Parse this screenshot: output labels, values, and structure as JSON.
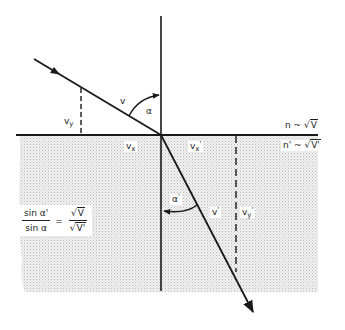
{
  "diagram": {
    "type": "refraction-of-velocity-vector",
    "colors": {
      "line": "#1a1a1a",
      "shading": "#d8d8d8",
      "background": "#ffffff"
    },
    "labels": {
      "v": "v",
      "alpha": "α",
      "vy": "v",
      "vy_sub": "y",
      "vx": "v",
      "vx_sub": "x",
      "vx_prime": "v",
      "vx_prime_sub": "x",
      "prime": "'",
      "v_prime": "v",
      "alpha_prime": "α",
      "vy_prime": "v",
      "vy_prime_sub": "y",
      "n_upper": "n ~ √",
      "n_upper_V": "V",
      "n_lower": "n' ~ √",
      "n_lower_V": "V'"
    },
    "formula": {
      "num_left": "sin α'",
      "den_left": "sin α",
      "equals": "=",
      "num_right_root": "√",
      "num_right": "V",
      "den_right_root": "√",
      "den_right": "V'"
    }
  }
}
